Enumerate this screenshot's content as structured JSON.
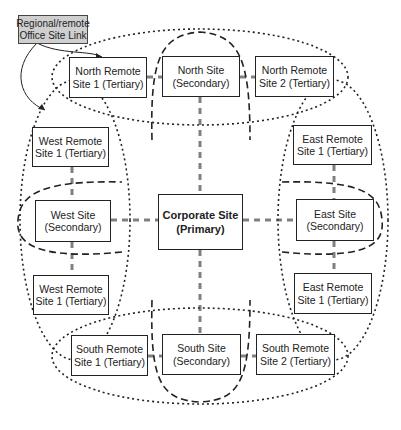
{
  "diagram": {
    "label": {
      "line1": "Regional/remote",
      "line2": "Office Site Link"
    },
    "primary": {
      "line1": "Corporate Site",
      "line2": "(Primary)"
    },
    "north": {
      "remote1": {
        "line1": "North Remote",
        "line2": "Site 1 (Tertiary)"
      },
      "site": {
        "line1": "North Site",
        "line2": "(Secondary)"
      },
      "remote2": {
        "line1": "North Remote",
        "line2": "Site 2 (Tertiary)"
      }
    },
    "west": {
      "remote_top": {
        "line1": "West Remote",
        "line2": "Site 1 (Tertiary)"
      },
      "site": {
        "line1": "West Site",
        "line2": "(Secondary)"
      },
      "remote_bottom": {
        "line1": "West Remote",
        "line2": "Site 1 (Tertiary)"
      }
    },
    "east": {
      "remote_top": {
        "line1": "East Remote",
        "line2": "Site 1 (Tertiary)"
      },
      "site": {
        "line1": "East Site",
        "line2": "(Secondary)"
      },
      "remote_bottom": {
        "line1": "East Remote",
        "line2": "Site 1 (Tertiary)"
      }
    },
    "south": {
      "remote1": {
        "line1": "South Remote",
        "line2": "Site 1 (Tertiary)"
      },
      "site": {
        "line1": "South Site",
        "line2": "(Secondary)"
      },
      "remote2": {
        "line1": "South Remote",
        "line2": "Site 2 (Tertiary)"
      }
    },
    "colors": {
      "box_border": "#222222",
      "label_fill": "#cfcfcf",
      "link_dash": "#777777",
      "boundary": "#222222"
    }
  }
}
